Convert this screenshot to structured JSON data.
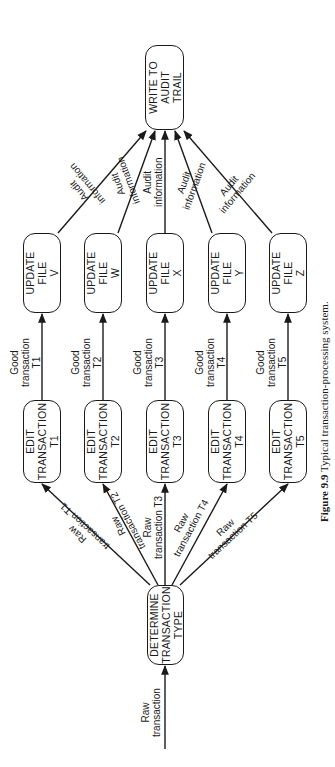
{
  "figure": {
    "number": "Figure 9.9",
    "caption": "Typical transaction-processing system.",
    "orientation": "rotated 90 degrees counter-clockwise on page"
  },
  "input": {
    "label_line1": "Raw",
    "label_line2": "transaction"
  },
  "dispatcher": {
    "line1": "DETERMINE",
    "line2": "TRANSACTION",
    "line3": "TYPE"
  },
  "branches": [
    {
      "raw_line1": "Raw",
      "raw_line2": "transaction T1",
      "edit_line1": "EDIT",
      "edit_line2": "TRANSACTION",
      "edit_line3": "T1",
      "good_line1": "Good",
      "good_line2": "transaction",
      "good_line3": "T1",
      "update_line1": "UPDATE",
      "update_line2": "FILE",
      "update_line3": "V",
      "audit_line1": "Audit",
      "audit_line2": "information"
    },
    {
      "raw_line1": "Raw",
      "raw_line2": "transaction T2",
      "edit_line1": "EDIT",
      "edit_line2": "TRANSACTION",
      "edit_line3": "T2",
      "good_line1": "Good",
      "good_line2": "transaction",
      "good_line3": "T2",
      "update_line1": "UPDATE",
      "update_line2": "FILE",
      "update_line3": "W",
      "audit_line1": "Audit",
      "audit_line2": "information"
    },
    {
      "raw_line1": "Raw",
      "raw_line2": "transaction T3",
      "edit_line1": "EDIT",
      "edit_line2": "TRANSACTION",
      "edit_line3": "T3",
      "good_line1": "Good",
      "good_line2": "transaction",
      "good_line3": "T3",
      "update_line1": "UPDATE",
      "update_line2": "FILE",
      "update_line3": "X",
      "audit_line1": "Audit",
      "audit_line2": "information"
    },
    {
      "raw_line1": "Raw",
      "raw_line2": "transaction T4",
      "edit_line1": "EDIT",
      "edit_line2": "TRANSACTION",
      "edit_line3": "T4",
      "good_line1": "Good",
      "good_line2": "transaction",
      "good_line3": "T4",
      "update_line1": "UPDATE",
      "update_line2": "FILE",
      "update_line3": "Y",
      "audit_line1": "Audit",
      "audit_line2": "information"
    },
    {
      "raw_line1": "Raw",
      "raw_line2": "transaction T5",
      "edit_line1": "EDIT",
      "edit_line2": "TRANSACTION",
      "edit_line3": "T5",
      "good_line1": "Good",
      "good_line2": "transaction",
      "good_line3": "T5",
      "update_line1": "UPDATE",
      "update_line2": "FILE",
      "update_line3": "Z",
      "audit_line1": "Audit",
      "audit_line2": "information"
    }
  ],
  "sink": {
    "line1": "WRITE TO",
    "line2": "AUDIT",
    "line3": "TRAIL"
  },
  "colors": {
    "ink": "#1a1a1a",
    "paper": "#ffffff"
  }
}
